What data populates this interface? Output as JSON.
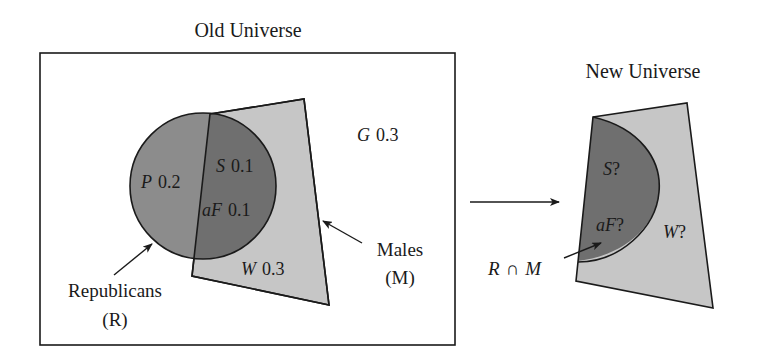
{
  "old_universe": {
    "title": "Old Universe",
    "regions": {
      "P": {
        "letter": "P",
        "value": "0.2"
      },
      "S": {
        "letter": "S",
        "value": "0.1"
      },
      "aF": {
        "letter": "aF",
        "value": "0.1"
      },
      "W": {
        "letter": "W",
        "value": "0.3"
      },
      "G": {
        "letter": "G",
        "value": "0.3"
      }
    },
    "sets": {
      "republicans": {
        "name": "Republicans",
        "symbol": "(R)"
      },
      "males": {
        "name": "Males",
        "symbol": "(M)"
      }
    }
  },
  "new_universe": {
    "title": "New Universe",
    "regions": {
      "S": {
        "letter": "S",
        "value": "?"
      },
      "aF": {
        "letter": "aF",
        "value": "?"
      },
      "W": {
        "letter": "W",
        "value": "?"
      }
    },
    "intersection_label": {
      "left": "R",
      "op": "∩",
      "right": "M"
    }
  },
  "colors": {
    "republican_only": "#8c8c8c",
    "intersection": "#6f6f6f",
    "males": "#c6c6c6",
    "outline": "#1a1a1a",
    "background": "#ffffff"
  }
}
